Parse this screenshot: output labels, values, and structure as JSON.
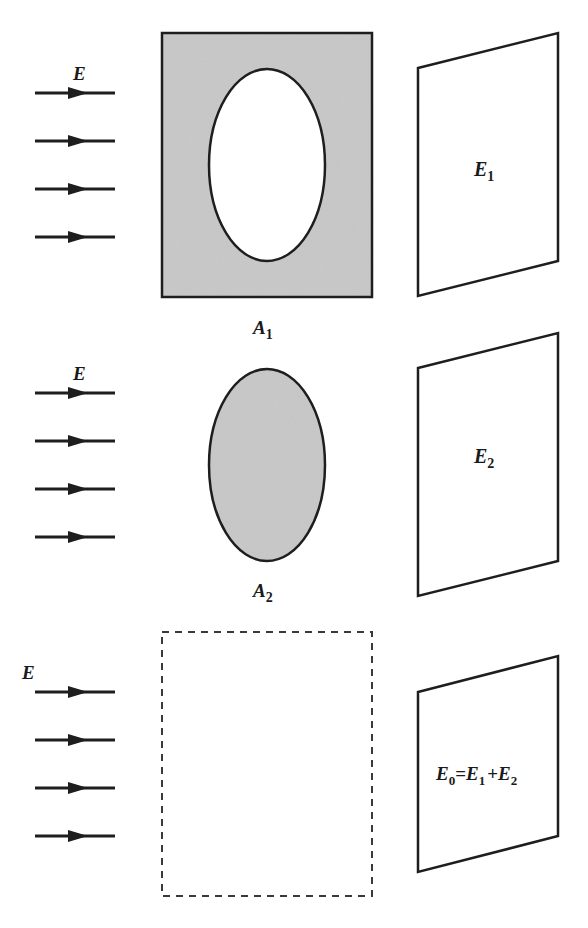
{
  "colors": {
    "line": "#1e1e1e",
    "fill_gray": "#c8c8c8",
    "background": "#ffffff"
  },
  "rows": [
    {
      "field_label": "E",
      "arrow_count": 4,
      "aperture": {
        "type": "screen-with-elliptical-hole",
        "label_main": "A",
        "label_sub": "1"
      },
      "screen": {
        "label_main": "E",
        "label_sub": "1"
      }
    },
    {
      "field_label": "E",
      "arrow_count": 4,
      "aperture": {
        "type": "elliptical-disk",
        "label_main": "A",
        "label_sub": "2"
      },
      "screen": {
        "label_main": "E",
        "label_sub": "2"
      }
    },
    {
      "field_label": "E",
      "arrow_count": 4,
      "aperture": {
        "type": "no-obstacle-dashed-outline"
      },
      "screen": {
        "equation": {
          "t0": "E",
          "s0": "0",
          "eq": "=",
          "t1": "E",
          "s1": "1",
          "plus": "+",
          "t2": "E",
          "s2": "2"
        }
      }
    }
  ]
}
